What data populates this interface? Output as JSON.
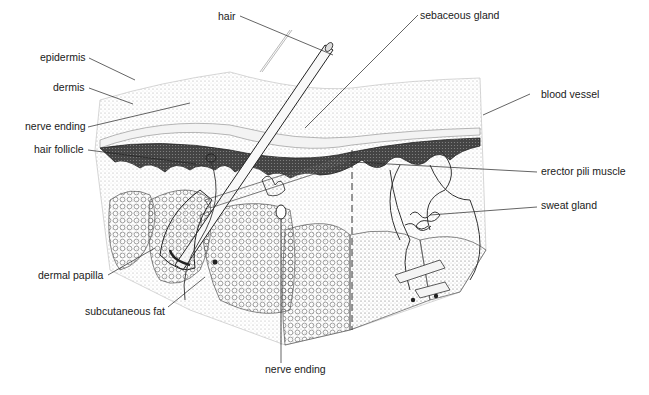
{
  "diagram": {
    "labels": {
      "epidermis": "epidermis",
      "dermis": "dermis",
      "nerve_ending_top": "nerve ending",
      "hair_follicle": "hair follicle",
      "dermal_papilla": "dermal papilla",
      "subcutaneous_fat": "subcutaneous fat",
      "nerve_ending_bottom": "nerve ending",
      "hair": "hair",
      "sebaceous_gland": "sebaceous gland",
      "blood_vessel": "blood vessel",
      "erector_pili_muscle": "erector pili muscle",
      "sweat_gland": "sweat gland"
    },
    "colors": {
      "ink": "#1a1a1a",
      "background": "#ffffff",
      "stipple": "#888888"
    }
  }
}
